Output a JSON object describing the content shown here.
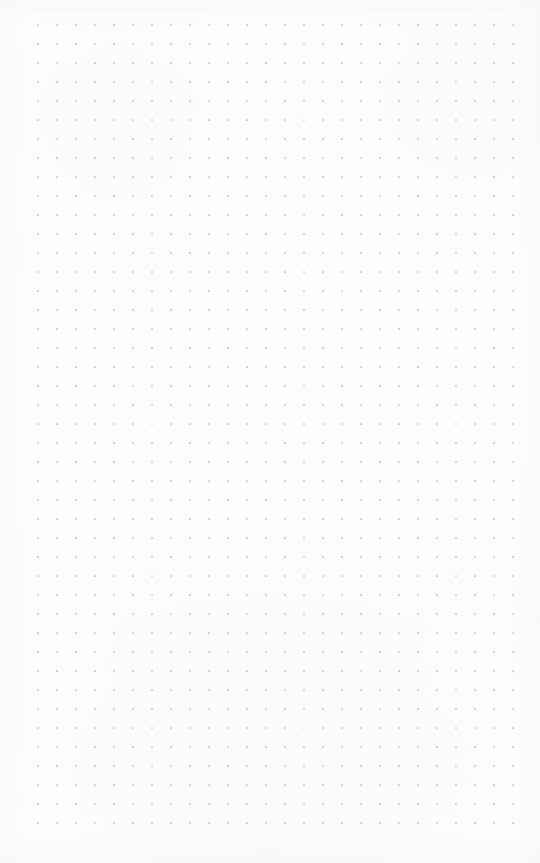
{
  "page": {
    "kind": "dot-grid-notebook-page",
    "width": 540,
    "height": 863,
    "background_color": "#fdfdfd",
    "content_text": "",
    "note": "Blank bullet-journal style dot grid page; no text, icons or controls are rendered."
  },
  "grid": {
    "label": "dot grid",
    "dot_color": "#c7c7cd",
    "dot_size_px": 1.6,
    "spacing_px": 19,
    "origin_x": 38,
    "origin_y": 25,
    "columns": 26,
    "rows": 43,
    "extent_right_px": 514,
    "extent_bottom_px": 823
  },
  "margins": {
    "left_px": 38,
    "top_px": 25,
    "right_px": 26,
    "bottom_px": 40
  }
}
